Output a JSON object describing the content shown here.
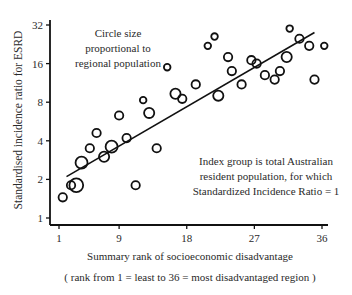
{
  "chart_data": {
    "type": "scatter",
    "title": "",
    "xlabel": "Summary rank of socioeconomic disadvantage",
    "xlabel_note": "( rank from 1 = least  to  36 = most disadvantaged region )",
    "ylabel": "Standardised incidence ratio for ESRD",
    "x_ticks": [
      1,
      9,
      18,
      27,
      36
    ],
    "y_ticks": [
      1,
      2,
      4,
      8,
      16,
      32
    ],
    "y_scale": "log2",
    "xlim": [
      0,
      37
    ],
    "ylim": [
      0.9,
      36
    ],
    "annotations": [
      {
        "id": "size_note",
        "lines": [
          "Circle size",
          "proportional to",
          "regional population"
        ]
      },
      {
        "id": "index_note",
        "lines": [
          "Index group is total Australian",
          "resident population, for which",
          "Standardized Incidence Ratio = 1"
        ]
      }
    ],
    "trendline": {
      "x": [
        2,
        35
      ],
      "y": [
        2.1,
        28
      ]
    },
    "points": [
      {
        "x": 1.5,
        "y": 1.45,
        "size": 4
      },
      {
        "x": 2.6,
        "y": 1.8,
        "size": 4
      },
      {
        "x": 3.3,
        "y": 1.8,
        "size": 7
      },
      {
        "x": 4.0,
        "y": 2.7,
        "size": 6
      },
      {
        "x": 5.1,
        "y": 3.5,
        "size": 4
      },
      {
        "x": 6.0,
        "y": 4.6,
        "size": 4
      },
      {
        "x": 7.0,
        "y": 3.0,
        "size": 5
      },
      {
        "x": 8.0,
        "y": 3.6,
        "size": 6
      },
      {
        "x": 9.0,
        "y": 6.3,
        "size": 4
      },
      {
        "x": 10.0,
        "y": 4.2,
        "size": 4
      },
      {
        "x": 11.2,
        "y": 1.8,
        "size": 4
      },
      {
        "x": 12.2,
        "y": 8.3,
        "size": 3
      },
      {
        "x": 13.0,
        "y": 6.6,
        "size": 5
      },
      {
        "x": 14.0,
        "y": 3.5,
        "size": 4
      },
      {
        "x": 15.4,
        "y": 15.0,
        "size": 3
      },
      {
        "x": 16.5,
        "y": 9.3,
        "size": 5
      },
      {
        "x": 17.4,
        "y": 8.5,
        "size": 4
      },
      {
        "x": 19.2,
        "y": 11.0,
        "size": 4
      },
      {
        "x": 20.8,
        "y": 22.0,
        "size": 3
      },
      {
        "x": 21.7,
        "y": 26.0,
        "size": 3
      },
      {
        "x": 22.2,
        "y": 9.0,
        "size": 5
      },
      {
        "x": 23.5,
        "y": 18.0,
        "size": 4
      },
      {
        "x": 24.0,
        "y": 14.0,
        "size": 4
      },
      {
        "x": 25.3,
        "y": 11.0,
        "size": 4
      },
      {
        "x": 26.6,
        "y": 17.0,
        "size": 4
      },
      {
        "x": 27.3,
        "y": 16.0,
        "size": 4
      },
      {
        "x": 28.4,
        "y": 13.0,
        "size": 4
      },
      {
        "x": 29.7,
        "y": 12.0,
        "size": 4
      },
      {
        "x": 30.4,
        "y": 14.0,
        "size": 4
      },
      {
        "x": 31.3,
        "y": 18.0,
        "size": 5
      },
      {
        "x": 31.7,
        "y": 30.0,
        "size": 3
      },
      {
        "x": 33.0,
        "y": 25.0,
        "size": 4
      },
      {
        "x": 34.3,
        "y": 22.0,
        "size": 4
      },
      {
        "x": 35.0,
        "y": 12.0,
        "size": 4
      },
      {
        "x": 36.3,
        "y": 22.0,
        "size": 3
      }
    ],
    "grid": false,
    "legend": "none"
  }
}
